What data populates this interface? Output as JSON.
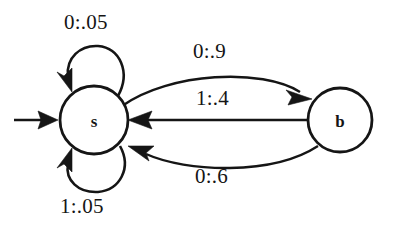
{
  "diagram": {
    "kind": "finite-state-machine",
    "title": "",
    "background_color": "#ffffff",
    "stroke_color": "#151515",
    "states": [
      {
        "id": "s",
        "label": "s",
        "cx": 94,
        "cy": 120,
        "r": 34,
        "is_start": true
      },
      {
        "id": "b",
        "label": "b",
        "cx": 340,
        "cy": 120,
        "r": 32,
        "is_start": false
      }
    ],
    "start_marker": {
      "name": "start-arrow",
      "from_x": 14,
      "to_x": 58,
      "y": 120
    },
    "transitions": [
      {
        "id": "s-self-top",
        "from": "s",
        "to": "s",
        "label": "0:.05",
        "input": "0",
        "probability": ".05",
        "shape": "self-loop-top"
      },
      {
        "id": "s-self-bottom",
        "from": "s",
        "to": "s",
        "label": "1:.05",
        "input": "1",
        "probability": ".05",
        "shape": "self-loop-bottom"
      },
      {
        "id": "s-to-b",
        "from": "s",
        "to": "b",
        "label": "0:.9",
        "input": "0",
        "probability": ".9",
        "shape": "curve-upper"
      },
      {
        "id": "b-to-s-mid",
        "from": "b",
        "to": "s",
        "label": "1:.4",
        "input": "1",
        "probability": ".4",
        "shape": "straight"
      },
      {
        "id": "b-to-s-lower",
        "from": "b",
        "to": "s",
        "label": "0:.6",
        "input": "0",
        "probability": ".6",
        "shape": "curve-lower"
      }
    ]
  }
}
